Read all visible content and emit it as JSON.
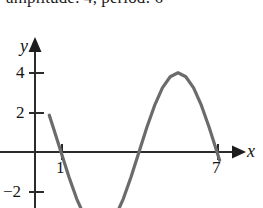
{
  "figure": {
    "caption": "amplitude: 4, period: 6",
    "caption_prefix": "amplitude: 4, period: 6",
    "background_color": "#ffffff",
    "axis_color": "#2b2b2b",
    "curve_color": "#6b6b6b",
    "text_color": "#141414"
  },
  "axes": {
    "x_axis_label": "x",
    "y_axis_label": "y",
    "x_ticks": [
      {
        "value": 1,
        "label": "1",
        "px": 62
      },
      {
        "value": 7,
        "label": "7",
        "px": 218
      }
    ],
    "y_ticks": [
      {
        "value": 4,
        "label": "4",
        "px": 73
      },
      {
        "value": 2,
        "label": "2",
        "px": 113
      },
      {
        "value": -2,
        "label": "−2",
        "px": 192
      }
    ],
    "origin_px": {
      "x": 35,
      "y": 152
    },
    "px_per_x_unit": 26,
    "px_per_y_unit": 19.8,
    "x_arrow_tip_px": 245,
    "y_arrow_tip_px": 38,
    "grid": false
  },
  "chart_data": {
    "type": "line",
    "title": "amplitude: 4, period: 6",
    "xlabel": "x",
    "ylabel": "y",
    "xlim": [
      -0.6,
      8.1
    ],
    "ylim": [
      -4.4,
      5.6
    ],
    "grid": false,
    "legend": null,
    "series": [
      {
        "name": "y = -4 sin(pi (x-1) / 3)",
        "amplitude": 4,
        "period": 6,
        "phase_shift": 1,
        "midline": 0,
        "color": "#6b6b6b",
        "zeros": [
          1,
          4,
          7
        ],
        "minimum": {
          "x": 2.5,
          "y": -4
        },
        "maximum": {
          "x": 5.5,
          "y": 4
        },
        "x": [
          0.55,
          0.8,
          1.0,
          1.3,
          1.6,
          1.9,
          2.2,
          2.5,
          2.8,
          3.1,
          3.4,
          3.7,
          4.0,
          4.3,
          4.6,
          4.9,
          5.2,
          5.5,
          5.8,
          6.1,
          6.4,
          6.7,
          7.0,
          7.1
        ],
        "y": [
          1.86,
          0.83,
          0.0,
          -1.24,
          -2.35,
          -3.24,
          -3.8,
          -4.0,
          -3.8,
          -3.24,
          -2.35,
          -1.24,
          0.0,
          1.24,
          2.35,
          3.24,
          3.8,
          4.0,
          3.8,
          3.24,
          2.35,
          1.24,
          0.0,
          -0.42
        ]
      }
    ]
  },
  "icons": {
    "x_arrow": "arrow-right-icon",
    "y_arrow": "arrow-up-icon"
  }
}
